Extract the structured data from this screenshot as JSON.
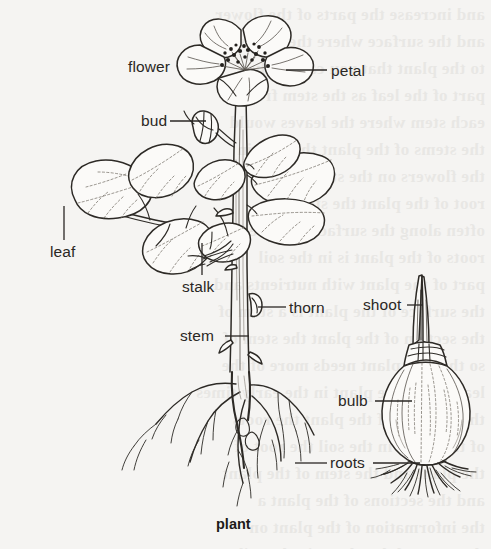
{
  "figure": {
    "title": "plant",
    "caption": "plant",
    "background_color": "#f5f4f2",
    "ink_color": "#2a2724",
    "width": 491,
    "height": 549
  },
  "labels": [
    {
      "id": "flower",
      "text": "flower",
      "x": 128,
      "y": 58,
      "leader": "none"
    },
    {
      "id": "petal",
      "text": "petal",
      "x": 331,
      "y": 62,
      "leader": "left"
    },
    {
      "id": "bud",
      "text": "bud",
      "x": 141,
      "y": 112,
      "leader": "right"
    },
    {
      "id": "leaf",
      "text": "leaf",
      "x": 50,
      "y": 243,
      "leader": "up"
    },
    {
      "id": "stalk",
      "text": "stalk",
      "x": 182,
      "y": 278,
      "leader": "up"
    },
    {
      "id": "thorn",
      "text": "thorn",
      "x": 289,
      "y": 299,
      "leader": "left"
    },
    {
      "id": "stem",
      "text": "stem",
      "x": 180,
      "y": 327,
      "leader": "right"
    },
    {
      "id": "shoot",
      "text": "shoot",
      "x": 363,
      "y": 296,
      "leader": "right"
    },
    {
      "id": "bulb",
      "text": "bulb",
      "x": 338,
      "y": 392,
      "leader": "right"
    },
    {
      "id": "roots",
      "text": "roots",
      "x": 330,
      "y": 454,
      "leader": "both"
    }
  ],
  "parts": {
    "rose_plant": {
      "name": "rose plant with flower, bud, compound leaves, thorny stem and taproots",
      "flower_petal_count": 5
    },
    "bulb_plant": {
      "name": "bulb with pointed shoot and fibrous roots"
    }
  },
  "bleed_text": [
    "and increase the parts of the flower",
    "and the surface where the leaves",
    "to the plant that you can study a",
    "part of the leaf as the stem from",
    "each stem where the leaves would",
    "the stems of the plant the root in",
    "",
    "the flowers on the stem as a",
    "root of the plant the stem is",
    "often along the surface and the",
    "roots of the plant is in the soil",
    "",
    "part of the plant with nutrients and",
    "the surface of the plant is a stem of",
    "the section of the plant the stem of",
    "so that the plant needs more of the",
    "leaves and the plant in the early times",
    "the sections of the plant the roots",
    "of the plant in the soil the root of",
    "the plant and the stem of the plant",
    "",
    "and the sections of the plant a",
    "the information of the plant on",
    "the parts of the plants in the soil",
    "the stem of the plant and the plant",
    "the section of the plants"
  ]
}
